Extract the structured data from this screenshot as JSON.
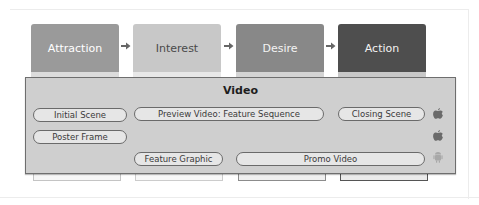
{
  "diagram": {
    "stages": [
      {
        "label": "Attraction",
        "color": "#999999",
        "text_color": "#ffffff",
        "strip": "#dcdcdc"
      },
      {
        "label": "Interest",
        "color": "#c6c6c6",
        "text_color": "#4a4a4a",
        "strip": "#e6e6e6"
      },
      {
        "label": "Desire",
        "color": "#888888",
        "text_color": "#f4f4f4",
        "strip": "#d4d4d4"
      },
      {
        "label": "Action",
        "color": "#4e4e4e",
        "text_color": "#f2f2f2",
        "strip": "#c8c8c8"
      }
    ],
    "arrow_glyph": "➜",
    "video": {
      "title": "Video",
      "items": [
        {
          "label": "Initial Scene"
        },
        {
          "label": "Preview Video: Feature Sequence"
        },
        {
          "label": "Closing Scene"
        },
        {
          "label": "Poster Frame"
        },
        {
          "label": "Feature Graphic"
        },
        {
          "label": "Promo Video"
        }
      ],
      "platforms": [
        {
          "name": "apple-icon"
        },
        {
          "name": "apple-icon"
        },
        {
          "name": "android-icon"
        }
      ]
    }
  }
}
